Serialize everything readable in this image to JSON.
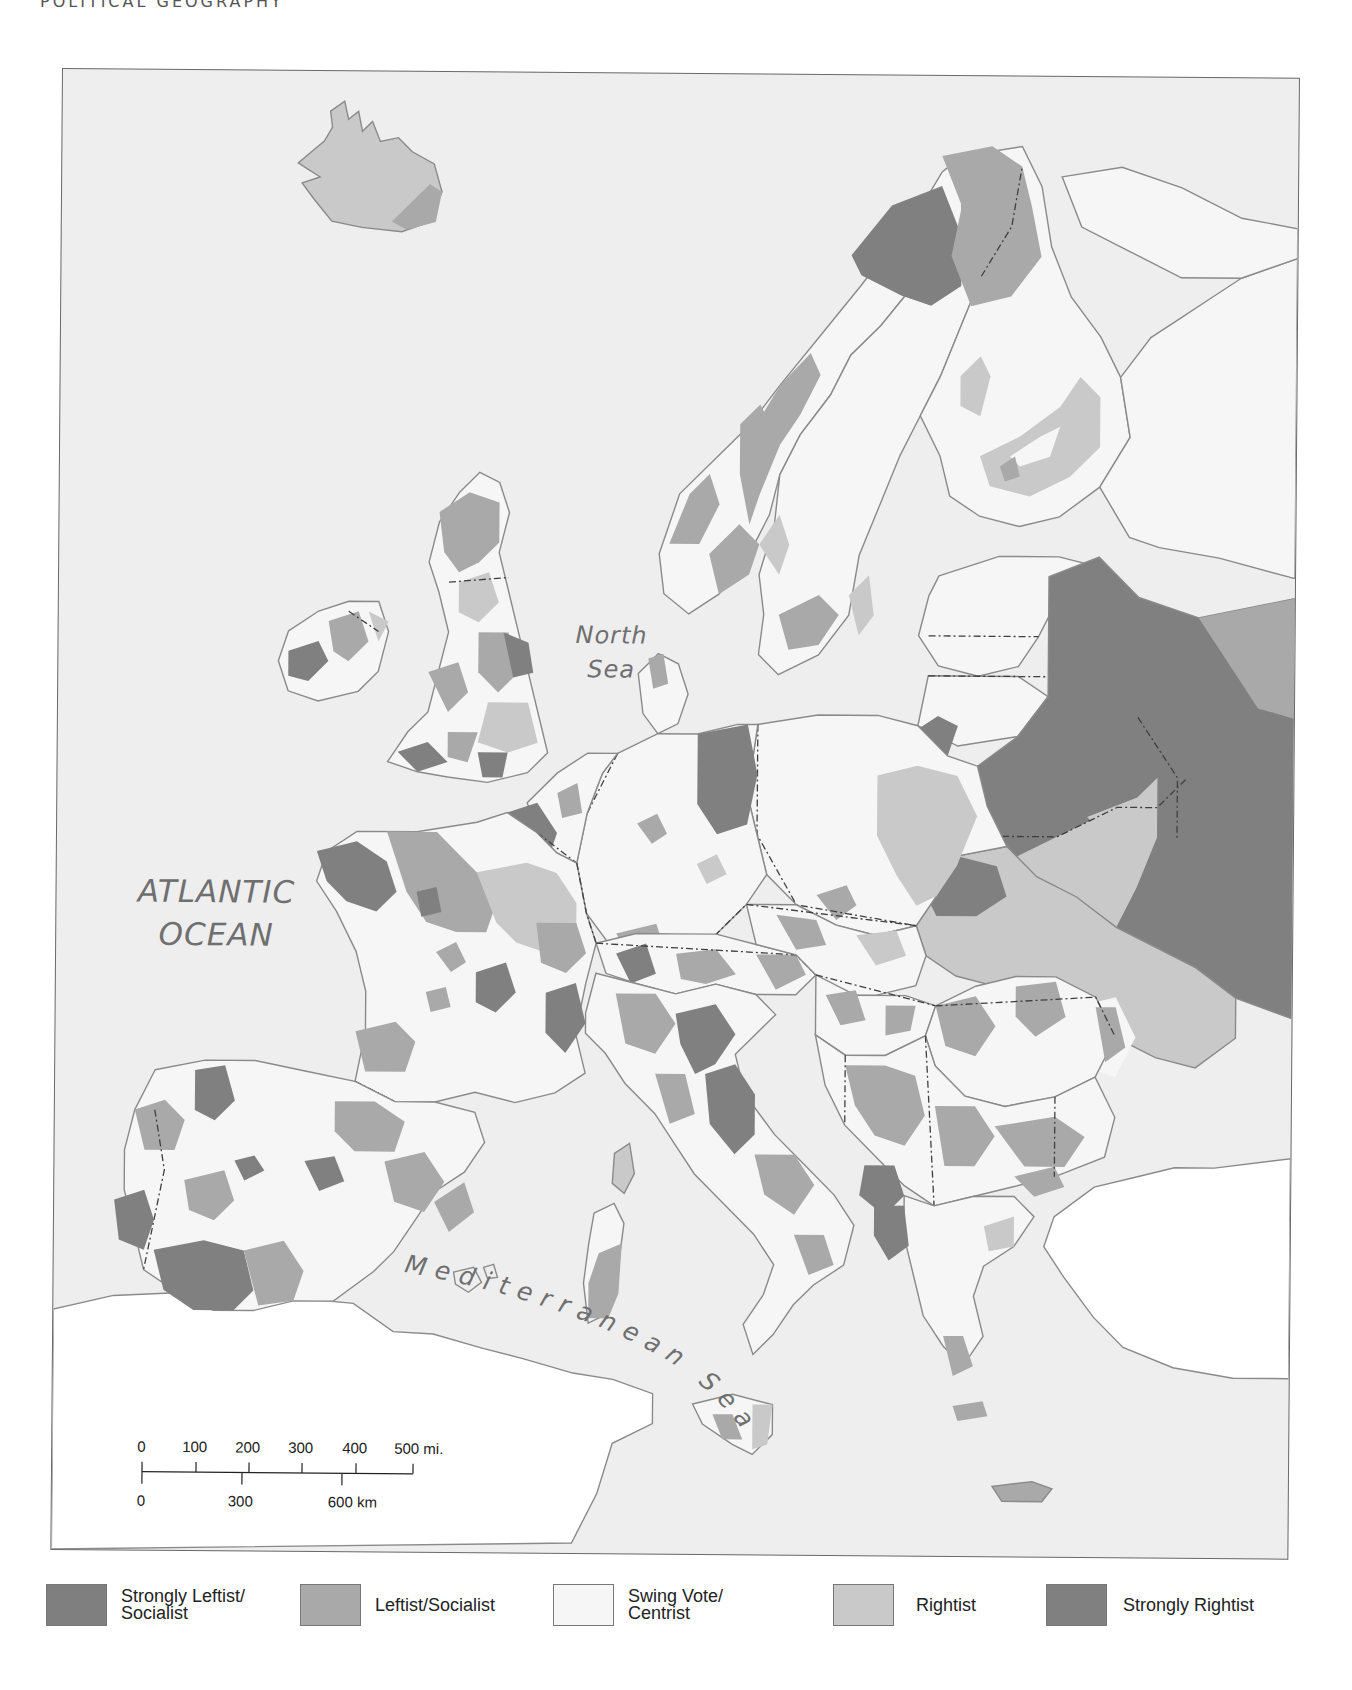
{
  "header": {
    "running_title": "POLITICAL GEOGRAPHY"
  },
  "colors": {
    "sea": "#eeeeee",
    "strongly_leftist": "#7f7f7f",
    "leftist": "#a9a9a9",
    "swing": "#f6f6f6",
    "rightist": "#c9c9c9",
    "strongly_rightist": "#808080",
    "coast": "#8a8a8a",
    "border": "#444444"
  },
  "map": {
    "labels": {
      "atlantic_line1": "ATLANTIC",
      "atlantic_line2": "OCEAN",
      "north_line1": "North",
      "north_line2": "Sea",
      "mediterranean": "Mediterranean",
      "med_sea": "Sea"
    }
  },
  "scale_bar": {
    "miles": [
      "0",
      "100",
      "200",
      "300",
      "400",
      "500 mi."
    ],
    "km": [
      "0",
      "300",
      "600 km"
    ]
  },
  "legend": {
    "items": [
      {
        "label": "Strongly Leftist/\nSocialist",
        "color": "#7f7f7f"
      },
      {
        "label": "Leftist/Socialist",
        "color": "#a9a9a9"
      },
      {
        "label": "Swing Vote/\nCentrist",
        "color": "#f6f6f6"
      },
      {
        "label": "Rightist",
        "color": "#c9c9c9"
      },
      {
        "label": "Strongly Rightist",
        "color": "#808080"
      }
    ]
  }
}
